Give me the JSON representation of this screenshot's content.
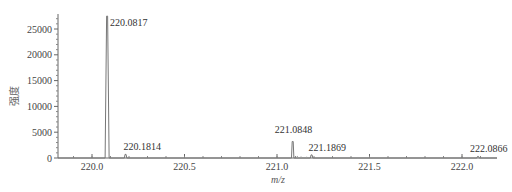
{
  "chart_data": {
    "type": "line",
    "title": "",
    "xlabel": "m/z",
    "ylabel": "强度",
    "xlim": [
      219.82,
      222.2
    ],
    "ylim": [
      0,
      28000
    ],
    "x_ticks": [
      220.0,
      220.5,
      221.0,
      221.5,
      222.0
    ],
    "x_tick_labels": [
      "220.0",
      "220.5",
      "221.0",
      "221.5",
      "222.0"
    ],
    "y_ticks": [
      0,
      5000,
      10000,
      15000,
      20000,
      25000
    ],
    "y_tick_labels": [
      "0",
      "5000",
      "10000",
      "15000",
      "20000",
      "25000"
    ],
    "grid": false,
    "legend": null,
    "peaks": [
      {
        "mz": 220.0817,
        "intensity": 27500,
        "label": "220.0817"
      },
      {
        "mz": 220.1814,
        "intensity": 700,
        "label": "220.1814"
      },
      {
        "mz": 221.0848,
        "intensity": 3200,
        "label": "221.0848"
      },
      {
        "mz": 221.1869,
        "intensity": 600,
        "label": "221.1869"
      },
      {
        "mz": 222.0866,
        "intensity": 300,
        "label": "222.0866"
      }
    ]
  }
}
